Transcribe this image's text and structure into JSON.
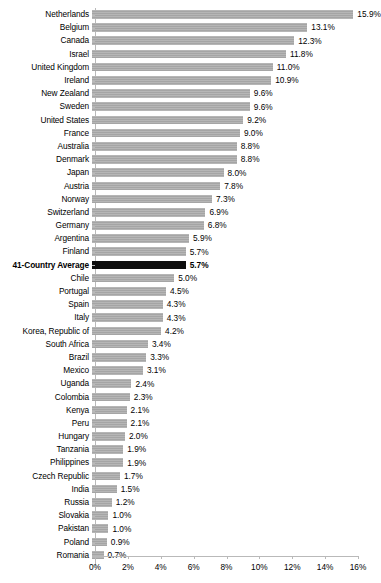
{
  "chart_data": {
    "type": "bar",
    "orientation": "horizontal",
    "title": "",
    "xlabel": "",
    "ylabel": "",
    "xlim": [
      0,
      16
    ],
    "grid": false,
    "legend": null,
    "value_suffix": "%",
    "xticks": [
      "0%",
      "2%",
      "4%",
      "6%",
      "8%",
      "10%",
      "12%",
      "14%",
      "16%"
    ],
    "xtick_values": [
      0,
      2,
      4,
      6,
      8,
      10,
      12,
      14,
      16
    ],
    "bar_color": "#a8a8a8",
    "highlight_color": "#0d0d0d",
    "categories": [
      "Netherlands",
      "Belgium",
      "Canada",
      "Israel",
      "United Kingdom",
      "Ireland",
      "New Zealand",
      "Sweden",
      "United States",
      "France",
      "Australia",
      "Denmark",
      "Japan",
      "Austria",
      "Norway",
      "Switzerland",
      "Germany",
      "Argentina",
      "Finland",
      "41-Country Average",
      "Chile",
      "Portugal",
      "Spain",
      "Italy",
      "Korea, Republic of",
      "South Africa",
      "Brazil",
      "Mexico",
      "Uganda",
      "Colombia",
      "Kenya",
      "Peru",
      "Hungary",
      "Tanzania",
      "Philippines",
      "Czech Republic",
      "India",
      "Russia",
      "Slovakia",
      "Pakistan",
      "Poland",
      "Romania"
    ],
    "values": [
      15.9,
      13.1,
      12.3,
      11.8,
      11.0,
      10.9,
      9.6,
      9.6,
      9.2,
      9.0,
      8.8,
      8.8,
      8.0,
      7.8,
      7.3,
      6.9,
      6.8,
      5.9,
      5.7,
      5.7,
      5.0,
      4.5,
      4.3,
      4.3,
      4.2,
      3.4,
      3.3,
      3.1,
      2.4,
      2.3,
      2.1,
      2.1,
      2.0,
      1.9,
      1.9,
      1.7,
      1.5,
      1.2,
      1.0,
      1.0,
      0.9,
      0.7
    ],
    "value_labels": [
      "15.9%",
      "13.1%",
      "12.3%",
      "11.8%",
      "11.0%",
      "10.9%",
      "9.6%",
      "9.6%",
      "9.2%",
      "9.0%",
      "8.8%",
      "8.8%",
      "8.0%",
      "7.8%",
      "7.3%",
      "6.9%",
      "6.8%",
      "5.9%",
      "5.7%",
      "5.7%",
      "5.0%",
      "4.5%",
      "4.3%",
      "4.3%",
      "4.2%",
      "3.4%",
      "3.3%",
      "3.1%",
      "2.4%",
      "2.3%",
      "2.1%",
      "2.1%",
      "2.0%",
      "1.9%",
      "1.9%",
      "1.7%",
      "1.5%",
      "1.2%",
      "1.0%",
      "1.0%",
      "0.9%",
      "0.7%"
    ],
    "highlight_index": 19
  }
}
